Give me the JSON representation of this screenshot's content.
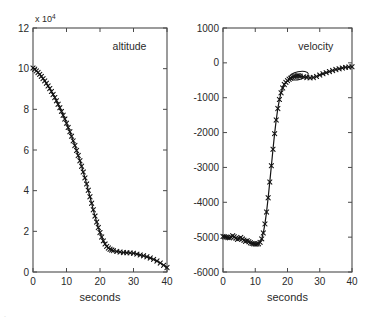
{
  "figure": {
    "background": "#ffffff",
    "axis_color": "#4a4a4a",
    "data_color": "#141414",
    "corner_artifact": "."
  },
  "chart_data": [
    {
      "type": "line",
      "panel": "left",
      "title": "altitude",
      "xlabel": "seconds",
      "ylabel": "",
      "y_exponent_label": "x 10",
      "y_exponent_sup": "4",
      "xlim": [
        0,
        40
      ],
      "ylim": [
        0,
        120000
      ],
      "xticks": [
        0,
        10,
        20,
        30,
        40
      ],
      "xtick_labels": [
        "0",
        "10",
        "20",
        "30",
        "40"
      ],
      "yticks": [
        0,
        20000,
        40000,
        60000,
        80000,
        100000,
        120000
      ],
      "ytick_labels": [
        "0",
        "2",
        "4",
        "6",
        "8",
        "10",
        "12"
      ],
      "grid": false,
      "marker": "x",
      "legend": "none",
      "x": [
        0,
        0.5,
        1,
        1.5,
        2,
        2.5,
        3,
        3.5,
        4,
        4.5,
        5,
        5.5,
        6,
        6.5,
        7,
        7.5,
        8,
        8.5,
        9,
        9.5,
        10,
        10.5,
        11,
        11.5,
        12,
        12.5,
        13,
        13.5,
        14,
        14.5,
        15,
        15.5,
        16,
        16.5,
        17,
        17.5,
        18,
        18.5,
        19,
        19.5,
        20,
        20.5,
        21,
        21.5,
        22,
        22.5,
        23,
        23.5,
        24,
        25,
        26,
        27,
        28,
        29,
        30,
        31,
        32,
        33,
        34,
        35,
        36,
        37,
        38,
        39,
        40
      ],
      "y": [
        100300,
        99700,
        98900,
        98100,
        97200,
        96200,
        95100,
        94000,
        92800,
        91500,
        90200,
        88800,
        87300,
        85800,
        84200,
        82500,
        80800,
        79000,
        77100,
        75200,
        73200,
        71100,
        69000,
        66800,
        64500,
        62200,
        59800,
        57300,
        54700,
        52000,
        49200,
        46300,
        43300,
        40200,
        37000,
        33800,
        30600,
        27500,
        24600,
        21900,
        19400,
        17200,
        15300,
        13800,
        12600,
        11800,
        11200,
        10800,
        10500,
        10100,
        9800,
        9600,
        9500,
        9400,
        9200,
        8800,
        8400,
        8000,
        7500,
        6900,
        6200,
        5400,
        4400,
        3300,
        2200
      ]
    },
    {
      "type": "line",
      "panel": "right",
      "title": "velocity",
      "xlabel": "seconds",
      "ylabel": "",
      "xlim": [
        0,
        40
      ],
      "ylim": [
        -6000,
        1000
      ],
      "xticks": [
        0,
        10,
        20,
        30,
        40
      ],
      "xtick_labels": [
        "0",
        "10",
        "20",
        "30",
        "40"
      ],
      "yticks": [
        -6000,
        -5000,
        -4000,
        -3000,
        -2000,
        -1000,
        0,
        1000
      ],
      "ytick_labels": [
        "-6000",
        "-5000",
        "-4000",
        "-3000",
        "-2000",
        "-1000",
        "0",
        "1000"
      ],
      "grid": false,
      "marker": "x",
      "legend": "none",
      "x": [
        0,
        0.5,
        1,
        1.5,
        2,
        2.5,
        3,
        3.5,
        4,
        4.5,
        5,
        5.5,
        6,
        6.5,
        7,
        7.5,
        8,
        8.5,
        9,
        9.5,
        10,
        10.5,
        11,
        11.5,
        12,
        12.5,
        13,
        13.5,
        14,
        14.5,
        15,
        15.5,
        16,
        16.5,
        17,
        17.5,
        18,
        18.5,
        19,
        19.5,
        20,
        20.5,
        21,
        21.5,
        22,
        22.5,
        23,
        23.5,
        24,
        25,
        26,
        27,
        28,
        29,
        30,
        31,
        32,
        33,
        34,
        35,
        36,
        37,
        38,
        39,
        40
      ],
      "y": [
        -4980,
        -4990,
        -5000,
        -5010,
        -5020,
        -5000,
        -4960,
        -4990,
        -5030,
        -5060,
        -5040,
        -5010,
        -5050,
        -5090,
        -5120,
        -5100,
        -5130,
        -5160,
        -5180,
        -5190,
        -5200,
        -5200,
        -5190,
        -5150,
        -5050,
        -4880,
        -4620,
        -4280,
        -3870,
        -3420,
        -2950,
        -2480,
        -2030,
        -1640,
        -1310,
        -1050,
        -860,
        -720,
        -620,
        -560,
        -510,
        -470,
        -440,
        -410,
        -390,
        -380,
        -370,
        -370,
        -380,
        -400,
        -420,
        -430,
        -420,
        -390,
        -350,
        -310,
        -280,
        -250,
        -220,
        -190,
        -170,
        -150,
        -130,
        -120,
        -110
      ],
      "overshoot_loop": {
        "present": true,
        "x_range": [
          20.5,
          26.5
        ],
        "y_range": [
          -480,
          -250
        ],
        "note": "open loop / tracking artifact in plateau region"
      }
    }
  ]
}
